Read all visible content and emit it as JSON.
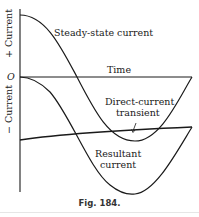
{
  "diagram": {
    "axis_labels": {
      "positive": "+ Current",
      "negative": "− Current",
      "origin": "O",
      "time": "Time"
    },
    "curves": [
      {
        "name": "Steady-state current",
        "label": "Steady-state current"
      },
      {
        "name": "Direct-current transient",
        "label_line1": "Direct-current",
        "label_line2": "transient"
      },
      {
        "name": "Resultant current",
        "label_line1": "Resultant",
        "label_line2": "current"
      }
    ],
    "caption": "Fig. 184."
  }
}
